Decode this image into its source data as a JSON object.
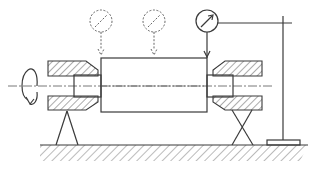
{
  "diagram": {
    "title": "Shaft runout measurement setup between centers",
    "type": "mechanical-schematic",
    "colors": {
      "line": "#3a3a3a",
      "background": "#ffffff"
    },
    "components": [
      {
        "id": "rotation-arrow",
        "label": "Rotation direction",
        "icon": "circular-arrow"
      },
      {
        "id": "left-center-housing",
        "label": "Left center housing (hatched section)"
      },
      {
        "id": "right-center-housing",
        "label": "Right center housing (hatched section)"
      },
      {
        "id": "workpiece-shaft",
        "label": "Workpiece shaft"
      },
      {
        "id": "dial-gauge-dashed-1",
        "label": "Alternate dial indicator position 1 (dashed)"
      },
      {
        "id": "dial-gauge-dashed-2",
        "label": "Alternate dial indicator position 2 (dashed)"
      },
      {
        "id": "dial-gauge-active",
        "label": "Dial indicator (active)"
      },
      {
        "id": "indicator-stand",
        "label": "Indicator stand with base"
      },
      {
        "id": "left-support",
        "label": "Left V-support"
      },
      {
        "id": "right-support",
        "label": "Right X-support"
      },
      {
        "id": "surface-plate",
        "label": "Ground / surface plate (hatched)"
      },
      {
        "id": "centerline",
        "label": "Axis centerline"
      }
    ]
  }
}
